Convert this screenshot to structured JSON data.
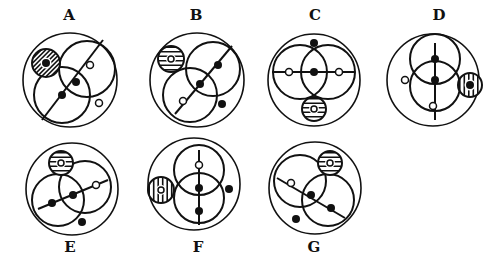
{
  "colors": {
    "stroke": "#111111",
    "background": "#ffffff"
  },
  "figures": [
    {
      "label": "A",
      "label_pos": [
        69,
        20
      ],
      "outer": [
        70,
        80,
        47
      ],
      "circles": [
        [
          62,
          95,
          28
        ],
        [
          87,
          69,
          28
        ]
      ],
      "line": [
        [
          42,
          120
        ],
        [
          103,
          40
        ]
      ],
      "hatched": {
        "c": [
          46,
          63,
          14
        ],
        "dir": "diag",
        "inner": "filled"
      },
      "dots": [
        [
          "filled",
          62,
          95,
          4
        ],
        [
          "filled",
          76,
          82,
          4
        ],
        [
          "open",
          90,
          65,
          3.5
        ],
        [
          "open",
          99,
          103,
          3.5
        ]
      ]
    },
    {
      "label": "B",
      "label_pos": [
        196,
        20
      ],
      "outer": [
        197,
        80,
        47
      ],
      "circles": [
        [
          190,
          95,
          27
        ],
        [
          213,
          69,
          27
        ]
      ],
      "line": [
        [
          175,
          114
        ],
        [
          232,
          46
        ]
      ],
      "hatched": {
        "c": [
          171,
          59,
          13
        ],
        "dir": "horiz",
        "inner": "open"
      },
      "dots": [
        [
          "filled",
          218,
          65,
          4
        ],
        [
          "filled",
          200,
          84,
          4
        ],
        [
          "open",
          183,
          101,
          3.5
        ],
        [
          "filled",
          222,
          104,
          4
        ]
      ]
    },
    {
      "label": "C",
      "label_pos": [
        315,
        20
      ],
      "outer": [
        314,
        80,
        46
      ],
      "circles": [
        [
          300,
          72,
          27
        ],
        [
          328,
          72,
          27
        ]
      ],
      "line": [
        [
          272,
          72
        ],
        [
          354,
          72
        ]
      ],
      "hatched": {
        "c": [
          314,
          109,
          12
        ],
        "dir": "horiz",
        "inner": "open"
      },
      "dots": [
        [
          "filled",
          314,
          43,
          4
        ],
        [
          "open",
          289,
          72,
          3.5
        ],
        [
          "filled",
          314,
          72,
          4
        ],
        [
          "open",
          339,
          72,
          3.5
        ]
      ]
    },
    {
      "label": "D",
      "label_pos": [
        439,
        20
      ],
      "outer": [
        433,
        80,
        46
      ],
      "circles": [
        [
          435,
          59,
          25
        ],
        [
          435,
          86,
          25
        ]
      ],
      "line": [
        [
          435,
          43
        ],
        [
          435,
          120
        ]
      ],
      "hatched": {
        "c": [
          470,
          85,
          12
        ],
        "dir": "vert",
        "inner": "filled"
      },
      "dots": [
        [
          "filled",
          435,
          59,
          4
        ],
        [
          "filled",
          435,
          80,
          4
        ],
        [
          "open",
          433,
          106,
          3.5
        ],
        [
          "open",
          405,
          80,
          3.5
        ]
      ]
    },
    {
      "label": "E",
      "label_pos": [
        70,
        252
      ],
      "outer": [
        72,
        189,
        46
      ],
      "circles": [
        [
          58,
          200,
          26
        ],
        [
          85,
          187,
          26
        ]
      ],
      "line": [
        [
          38,
          209
        ],
        [
          108,
          180
        ]
      ],
      "hatched": {
        "c": [
          61,
          163,
          12
        ],
        "dir": "horiz",
        "inner": "open"
      },
      "dots": [
        [
          "filled",
          52,
          203,
          4
        ],
        [
          "filled",
          73,
          195,
          4
        ],
        [
          "open",
          96,
          185,
          3.5
        ],
        [
          "filled",
          82,
          222,
          4
        ]
      ]
    },
    {
      "label": "F",
      "label_pos": [
        198,
        252
      ],
      "outer": [
        194,
        184,
        46
      ],
      "circles": [
        [
          199,
          170,
          25
        ],
        [
          199,
          198,
          25
        ]
      ],
      "line": [
        [
          199,
          150
        ],
        [
          199,
          225
        ]
      ],
      "hatched": {
        "c": [
          161,
          190,
          13
        ],
        "dir": "vert",
        "inner": "open"
      },
      "dots": [
        [
          "open",
          199,
          165,
          3.5
        ],
        [
          "filled",
          199,
          188,
          4
        ],
        [
          "filled",
          199,
          211,
          4
        ],
        [
          "filled",
          229,
          189,
          4
        ]
      ]
    },
    {
      "label": "G",
      "label_pos": [
        314,
        252
      ],
      "outer": [
        315,
        188,
        46
      ],
      "circles": [
        [
          300,
          181,
          26
        ],
        [
          328,
          200,
          26
        ]
      ],
      "line": [
        [
          277,
          178
        ],
        [
          345,
          218
        ]
      ],
      "hatched": {
        "c": [
          330,
          163,
          12
        ],
        "dir": "horiz",
        "inner": "open"
      },
      "dots": [
        [
          "open",
          291,
          183,
          3.5
        ],
        [
          "filled",
          311,
          195,
          4
        ],
        [
          "filled",
          331,
          208,
          4
        ],
        [
          "filled",
          296,
          219,
          4
        ]
      ]
    }
  ]
}
